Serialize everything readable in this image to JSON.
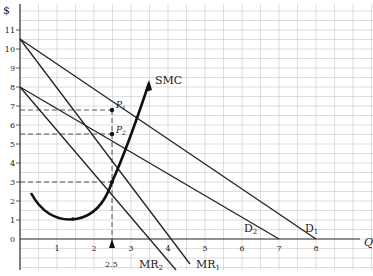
{
  "chart_data": {
    "type": "line",
    "title": "",
    "xlabel": "Q",
    "ylabel": "$",
    "xlim": [
      0,
      9
    ],
    "ylim": [
      -1.5,
      11.8
    ],
    "grid": true,
    "x_ticks": [
      "1",
      "2",
      "3",
      "4",
      "5",
      "6",
      "7",
      "8"
    ],
    "y_ticks": [
      "0",
      "1",
      "2",
      "3",
      "4",
      "5",
      "6",
      "7",
      "8",
      "9",
      "10",
      "11"
    ],
    "series": [
      {
        "name": "D1",
        "points": [
          [
            0,
            10.5
          ],
          [
            8,
            0
          ]
        ]
      },
      {
        "name": "D2",
        "points": [
          [
            0,
            8
          ],
          [
            7,
            0
          ]
        ]
      },
      {
        "name": "MR1",
        "points": [
          [
            0,
            10.5
          ],
          [
            4,
            0
          ],
          [
            4.6,
            -0.8
          ]
        ]
      },
      {
        "name": "MR2",
        "points": [
          [
            0,
            8
          ],
          [
            3.5,
            0
          ],
          [
            4.2,
            -1.6
          ]
        ]
      },
      {
        "name": "SMC",
        "points": [
          [
            0.3,
            2.4
          ],
          [
            0.8,
            1.5
          ],
          [
            1.5,
            1.05
          ],
          [
            2.0,
            1.6
          ],
          [
            2.5,
            3.0
          ],
          [
            2.9,
            5.2
          ],
          [
            3.3,
            8.2
          ]
        ]
      }
    ],
    "annotations": [
      {
        "label": "P1",
        "x": 2.5,
        "y": 6.8
      },
      {
        "label": "P2",
        "x": 2.5,
        "y": 5.5
      },
      {
        "label": "2.5",
        "x": 2.5,
        "y": 0,
        "type": "arrow"
      },
      {
        "label": "SMC",
        "x": 3.4,
        "y": 8.2
      }
    ],
    "dashed_lines": [
      {
        "y": 6.8,
        "x_to": 2.5
      },
      {
        "y": 5.5,
        "x_to": 2.5
      },
      {
        "y": 3.0,
        "x_to": 2.5
      },
      {
        "x": 2.5,
        "y_from": 6.8,
        "y_to": -0.5
      }
    ],
    "legend": "inline labels"
  },
  "labels": {
    "y_axis": "$",
    "x_axis": "Q",
    "smc": "SMC",
    "p1": "P",
    "p1_sub": "1",
    "p2": "P",
    "p2_sub": "2",
    "d1": "D",
    "d1_sub": "1",
    "d2": "D",
    "d2_sub": "2",
    "mr1": "MR",
    "mr1_sub": "1",
    "mr2": "MR",
    "mr2_sub": "2",
    "q_marker": "2.5"
  },
  "ticks": {
    "x": [
      "1",
      "2",
      "3",
      "4",
      "5",
      "6",
      "7",
      "8"
    ],
    "y": [
      "0",
      "1",
      "2",
      "3",
      "4",
      "5",
      "6",
      "7",
      "8",
      "9",
      "10",
      "11"
    ]
  }
}
